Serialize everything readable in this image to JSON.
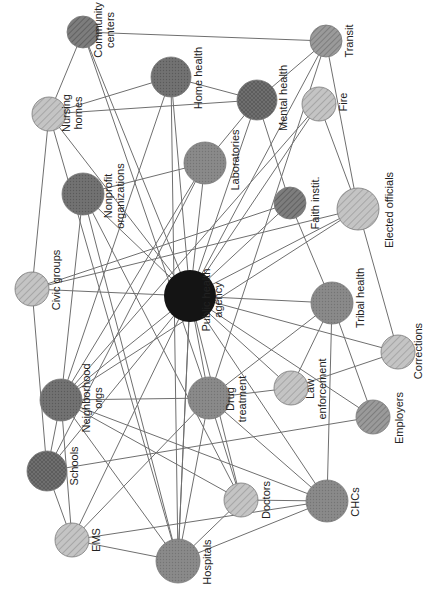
{
  "diagram": {
    "type": "network",
    "orientation": "rotated-90-clockwise",
    "center_node": "public_health_agency",
    "colors": {
      "edge": "#6f6f6f",
      "center": "#141414",
      "dark": "#6e6e6e",
      "medium": "#8c8c8c",
      "light": "#bdbdbd",
      "label": "#222222"
    },
    "nodes": [
      {
        "id": "public_health_agency",
        "label": [
          "Public health",
          "agency"
        ],
        "x": 190,
        "y": 296,
        "r": 26,
        "style": "center",
        "lx": 212,
        "ly": 300
      },
      {
        "id": "community_centers",
        "label": [
          "Community",
          "centers"
        ],
        "x": 83,
        "y": 32,
        "r": 16,
        "style": "dark-hatch",
        "lx": 104,
        "ly": 30
      },
      {
        "id": "home_health",
        "label": [
          "Home health"
        ],
        "x": 171,
        "y": 77,
        "r": 20,
        "style": "dark-dots",
        "lx": 198,
        "ly": 78
      },
      {
        "id": "transit",
        "label": [
          "Transit"
        ],
        "x": 326,
        "y": 41,
        "r": 16,
        "style": "medium-hatch",
        "lx": 349,
        "ly": 41
      },
      {
        "id": "mental_health",
        "label": [
          "Mental health"
        ],
        "x": 257,
        "y": 100,
        "r": 20,
        "style": "dark-cross",
        "lx": 283,
        "ly": 98
      },
      {
        "id": "fire",
        "label": [
          "Fire"
        ],
        "x": 319,
        "y": 104,
        "r": 17,
        "style": "light-hatch",
        "lx": 343,
        "ly": 102
      },
      {
        "id": "nursing_homes",
        "label": [
          "Nursing",
          "homes"
        ],
        "x": 49,
        "y": 114,
        "r": 17,
        "style": "light-hatch",
        "lx": 72,
        "ly": 113
      },
      {
        "id": "laboratories",
        "label": [
          "Laboratories"
        ],
        "x": 205,
        "y": 163,
        "r": 21,
        "style": "medium-dots",
        "lx": 235,
        "ly": 160
      },
      {
        "id": "nonprofit_organizations",
        "label": [
          "Nonprofit",
          "organizations"
        ],
        "x": 83,
        "y": 194,
        "r": 21,
        "style": "dark-dots",
        "lx": 114,
        "ly": 196
      },
      {
        "id": "faith_institutions",
        "label": [
          "Faith instit."
        ],
        "x": 290,
        "y": 203,
        "r": 16,
        "style": "dark-hatch",
        "lx": 315,
        "ly": 203
      },
      {
        "id": "elected_officials",
        "label": [
          "Elected officials"
        ],
        "x": 358,
        "y": 209,
        "r": 21,
        "style": "light-hatch",
        "lx": 389,
        "ly": 210
      },
      {
        "id": "civic_groups",
        "label": [
          "Civic groups"
        ],
        "x": 32,
        "y": 289,
        "r": 17,
        "style": "light-hatch",
        "lx": 56,
        "ly": 280
      },
      {
        "id": "tribal_health",
        "label": [
          "Tribal health"
        ],
        "x": 332,
        "y": 303,
        "r": 21,
        "style": "medium-dots",
        "lx": 360,
        "ly": 298
      },
      {
        "id": "neighborhood_orgs",
        "label": [
          "Neighborhood",
          "orgs"
        ],
        "x": 61,
        "y": 400,
        "r": 21,
        "style": "dark-dots",
        "lx": 92,
        "ly": 398
      },
      {
        "id": "drug_treatment",
        "label": [
          "Drug",
          "treatment"
        ],
        "x": 209,
        "y": 398,
        "r": 21,
        "style": "medium-dots",
        "lx": 236,
        "ly": 399
      },
      {
        "id": "law_enforcement",
        "label": [
          "Law",
          "enforcement"
        ],
        "x": 291,
        "y": 388,
        "r": 17,
        "style": "light-hatch",
        "lx": 316,
        "ly": 389
      },
      {
        "id": "corrections",
        "label": [
          "Corrections"
        ],
        "x": 398,
        "y": 352,
        "r": 17,
        "style": "light-hatch",
        "lx": 418,
        "ly": 351
      },
      {
        "id": "employers",
        "label": [
          "Employers"
        ],
        "x": 373,
        "y": 417,
        "r": 17,
        "style": "medium-hatch",
        "lx": 399,
        "ly": 418
      },
      {
        "id": "schools",
        "label": [
          "Schools"
        ],
        "x": 47,
        "y": 471,
        "r": 20,
        "style": "dark-cross",
        "lx": 74,
        "ly": 466
      },
      {
        "id": "ems",
        "label": [
          "EMS"
        ],
        "x": 72,
        "y": 540,
        "r": 17,
        "style": "light-hatch",
        "lx": 96,
        "ly": 540
      },
      {
        "id": "doctors",
        "label": [
          "Doctors"
        ],
        "x": 241,
        "y": 500,
        "r": 17,
        "style": "light-hatch",
        "lx": 266,
        "ly": 500
      },
      {
        "id": "chcs",
        "label": [
          "CHCs"
        ],
        "x": 327,
        "y": 501,
        "r": 21,
        "style": "medium-dots",
        "lx": 355,
        "ly": 502
      },
      {
        "id": "hospitals",
        "label": [
          "Hospitals"
        ],
        "x": 178,
        "y": 561,
        "r": 22,
        "style": "medium-dots",
        "lx": 207,
        "ly": 562
      }
    ],
    "edges": [
      [
        "public_health_agency",
        "community_centers"
      ],
      [
        "public_health_agency",
        "home_health"
      ],
      [
        "public_health_agency",
        "transit"
      ],
      [
        "public_health_agency",
        "mental_health"
      ],
      [
        "public_health_agency",
        "fire"
      ],
      [
        "public_health_agency",
        "nursing_homes"
      ],
      [
        "public_health_agency",
        "laboratories"
      ],
      [
        "public_health_agency",
        "nonprofit_organizations"
      ],
      [
        "public_health_agency",
        "faith_institutions"
      ],
      [
        "public_health_agency",
        "elected_officials"
      ],
      [
        "public_health_agency",
        "civic_groups"
      ],
      [
        "public_health_agency",
        "tribal_health"
      ],
      [
        "public_health_agency",
        "neighborhood_orgs"
      ],
      [
        "public_health_agency",
        "drug_treatment"
      ],
      [
        "public_health_agency",
        "law_enforcement"
      ],
      [
        "public_health_agency",
        "corrections"
      ],
      [
        "public_health_agency",
        "employers"
      ],
      [
        "public_health_agency",
        "schools"
      ],
      [
        "public_health_agency",
        "ems"
      ],
      [
        "public_health_agency",
        "doctors"
      ],
      [
        "public_health_agency",
        "chcs"
      ],
      [
        "public_health_agency",
        "hospitals"
      ],
      [
        "community_centers",
        "transit"
      ],
      [
        "community_centers",
        "nursing_homes"
      ],
      [
        "community_centers",
        "drug_treatment"
      ],
      [
        "home_health",
        "nursing_homes"
      ],
      [
        "home_health",
        "mental_health"
      ],
      [
        "home_health",
        "neighborhood_orgs"
      ],
      [
        "home_health",
        "hospitals"
      ],
      [
        "transit",
        "mental_health"
      ],
      [
        "transit",
        "elected_officials"
      ],
      [
        "transit",
        "drug_treatment"
      ],
      [
        "nursing_homes",
        "mental_health"
      ],
      [
        "nursing_homes",
        "civic_groups"
      ],
      [
        "nursing_homes",
        "hospitals"
      ],
      [
        "mental_health",
        "laboratories"
      ],
      [
        "mental_health",
        "faith_institutions"
      ],
      [
        "fire",
        "elected_officials"
      ],
      [
        "fire",
        "neighborhood_orgs"
      ],
      [
        "laboratories",
        "nonprofit_organizations"
      ],
      [
        "laboratories",
        "neighborhood_orgs"
      ],
      [
        "laboratories",
        "schools"
      ],
      [
        "nonprofit_organizations",
        "doctors"
      ],
      [
        "nonprofit_organizations",
        "hospitals"
      ],
      [
        "nonprofit_organizations",
        "neighborhood_orgs"
      ],
      [
        "faith_institutions",
        "civic_groups"
      ],
      [
        "faith_institutions",
        "tribal_health"
      ],
      [
        "elected_officials",
        "civic_groups"
      ],
      [
        "elected_officials",
        "neighborhood_orgs"
      ],
      [
        "elected_officials",
        "corrections"
      ],
      [
        "civic_groups",
        "schools"
      ],
      [
        "tribal_health",
        "drug_treatment"
      ],
      [
        "tribal_health",
        "law_enforcement"
      ],
      [
        "tribal_health",
        "employers"
      ],
      [
        "tribal_health",
        "chcs"
      ],
      [
        "neighborhood_orgs",
        "drug_treatment"
      ],
      [
        "neighborhood_orgs",
        "schools"
      ],
      [
        "neighborhood_orgs",
        "ems"
      ],
      [
        "neighborhood_orgs",
        "chcs"
      ],
      [
        "neighborhood_orgs",
        "doctors"
      ],
      [
        "neighborhood_orgs",
        "hospitals"
      ],
      [
        "drug_treatment",
        "law_enforcement"
      ],
      [
        "drug_treatment",
        "hospitals"
      ],
      [
        "drug_treatment",
        "doctors"
      ],
      [
        "drug_treatment",
        "chcs"
      ],
      [
        "law_enforcement",
        "corrections"
      ],
      [
        "schools",
        "employers"
      ],
      [
        "schools",
        "ems"
      ],
      [
        "ems",
        "hospitals"
      ],
      [
        "ems",
        "drug_treatment"
      ],
      [
        "ems",
        "chcs"
      ],
      [
        "doctors",
        "hospitals"
      ],
      [
        "doctors",
        "chcs"
      ],
      [
        "chcs",
        "hospitals"
      ],
      [
        "hospitals",
        "public_health_agency"
      ]
    ]
  }
}
